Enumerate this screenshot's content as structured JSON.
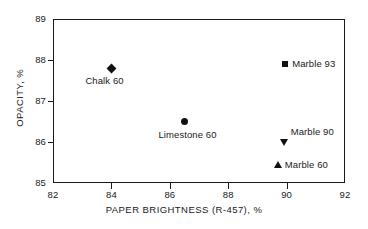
{
  "chart_data": {
    "type": "scatter",
    "title": "",
    "xlabel": "PAPER BRIGHTNESS (R-457), %",
    "ylabel": "OPACITY, %",
    "xlim": [
      82,
      92
    ],
    "ylim": [
      85,
      89
    ],
    "xticks": [
      "82",
      "84",
      "86",
      "88",
      "90",
      "92"
    ],
    "yticks": [
      "85",
      "86",
      "87",
      "88",
      "89"
    ],
    "grid": false,
    "legend_position": "none",
    "points": [
      {
        "label": "Chalk 60",
        "x": 84.0,
        "y": 87.8,
        "marker": "diamond",
        "label_position": "below"
      },
      {
        "label": "Marble 93",
        "x": 89.95,
        "y": 87.9,
        "marker": "square",
        "label_position": "right"
      },
      {
        "label": "Limestone 60",
        "x": 86.5,
        "y": 86.5,
        "marker": "circle",
        "label_position": "below"
      },
      {
        "label": "Marble 90",
        "x": 89.9,
        "y": 86.0,
        "marker": "triangle-down",
        "label_position": "above-right"
      },
      {
        "label": "Marble 60",
        "x": 89.7,
        "y": 85.45,
        "marker": "triangle-up",
        "label_position": "right"
      }
    ]
  },
  "colors": {
    "marker": "#111111",
    "axis": "#1a1a1a",
    "background": "#ffffff"
  }
}
